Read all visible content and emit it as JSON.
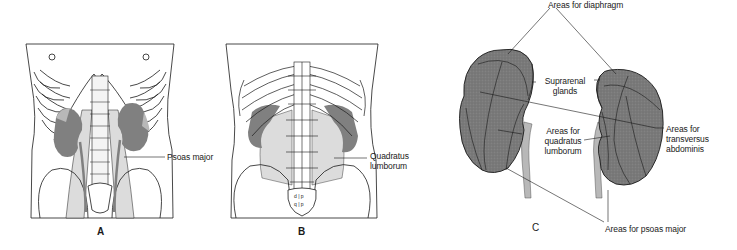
{
  "figure": {
    "panels": [
      {
        "letter": "A",
        "description": "Anterior view of posterior abdominal wall with kidneys and psoas major",
        "labels": [
          "Psoas major"
        ]
      },
      {
        "letter": "B",
        "description": "Posterior view of lumbar region with kidneys and quadratus lumborum",
        "labels": [
          "Quadratus",
          "lumborum"
        ]
      },
      {
        "letter": "C",
        "description": "Posterior surfaces of kidneys showing muscle contact areas",
        "labels": {
          "diaphragm": "Areas for diaphragm",
          "suprarenal_1": "Suprarenal",
          "suprarenal_2": "glands",
          "quadratus_1": "Areas for",
          "quadratus_2": "quadratus",
          "quadratus_3": "lumborum",
          "transversus_1": "Areas for",
          "transversus_2": "transversus",
          "transversus_3": "abdominis",
          "psoas": "Areas for psoas major"
        }
      }
    ],
    "colors": {
      "kidney_fill": "#7a7a7a",
      "kidney_light": "#b8b8b8",
      "muscle_fill": "#d9d9d9",
      "line": "#1a1a1a",
      "background": "#ffffff"
    }
  }
}
